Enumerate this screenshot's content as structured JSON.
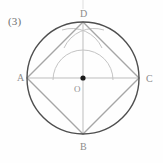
{
  "figure": {
    "item_number": "(3)",
    "caption": "",
    "labels": {
      "vertex_top": "D",
      "vertex_left": "A",
      "vertex_right": "C",
      "vertex_bottom": "B",
      "center": "O"
    },
    "colors": {
      "circle_stroke": "#4e4e4e",
      "square_stroke": "#a6a6a6",
      "diameter_stroke": "#bdbdbd",
      "construction_arc_stroke": "#c4c4c4",
      "center_dot_fill": "#1a1a1a",
      "label_text": "#8c8c8c",
      "number_text": "#6f6f6f",
      "background": "#fefefe"
    },
    "geometry": {
      "center_x": 83,
      "center_y": 78,
      "circle_radius": 56,
      "construction_arc_radius": 30,
      "square_vertices": [
        {
          "name": "A",
          "x": 27,
          "y": 78
        },
        {
          "name": "B",
          "x": 83,
          "y": 134
        },
        {
          "name": "C",
          "x": 139,
          "y": 78
        },
        {
          "name": "D",
          "x": 83,
          "y": 22
        }
      ],
      "center_dot_radius": 2.6,
      "tick_top_x": 83,
      "tick_top_y1": 0,
      "tick_top_y2": 9
    },
    "elements": {
      "circle_name": "circumscribed circle",
      "square_name": "inscribed square ABCD",
      "horizontal_diameter": "AC",
      "vertical_diameter": "DB"
    }
  }
}
